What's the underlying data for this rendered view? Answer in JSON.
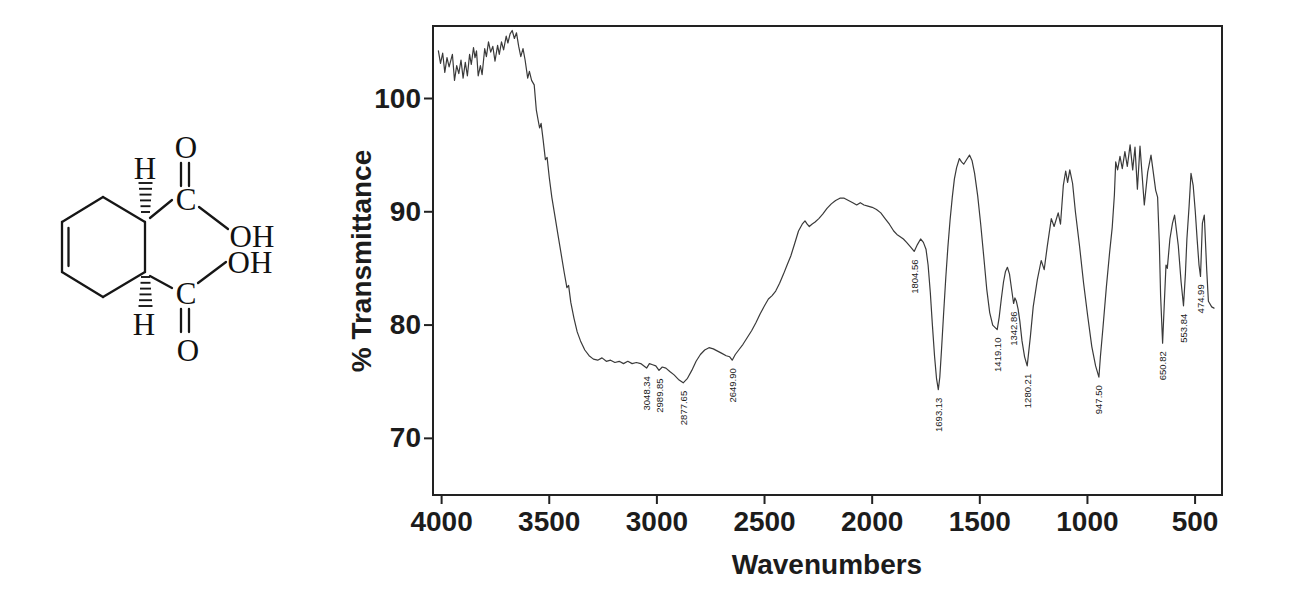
{
  "structure": {
    "compound": "cis-4-cyclohexene-1,2-dicarboxylic acid",
    "atoms": [
      {
        "id": "o-upper",
        "label": "O"
      },
      {
        "id": "c-upper",
        "label": "C"
      },
      {
        "id": "oh-upper",
        "label": "OH"
      },
      {
        "id": "oh-lower",
        "label": "OH"
      },
      {
        "id": "c-lower",
        "label": "C"
      },
      {
        "id": "o-lower",
        "label": "O"
      },
      {
        "id": "h-upper",
        "label": "H"
      },
      {
        "id": "h-lower",
        "label": "H"
      }
    ]
  },
  "chart_data": {
    "type": "line",
    "title": "",
    "xlabel": "Wavenumbers",
    "ylabel": "% Transmittance",
    "x_axis": {
      "min": 375,
      "max": 4040,
      "reversed": true,
      "ticks": [
        4000,
        3500,
        3000,
        2500,
        2000,
        1500,
        1000,
        500
      ]
    },
    "y_axis": {
      "min": 65,
      "max": 106.4,
      "ticks": [
        70,
        80,
        90,
        100
      ]
    },
    "grid": false,
    "legend": false,
    "peak_labels": [
      {
        "text": "3048.34",
        "wn": 3048.34,
        "t": 75.85
      },
      {
        "text": "2989.85",
        "wn": 2989.85,
        "t": 75.65
      },
      {
        "text": "2877.65",
        "wn": 2877.65,
        "t": 74.55
      },
      {
        "text": "2649.90",
        "wn": 2649.9,
        "t": 76.55
      },
      {
        "text": "1804.56",
        "wn": 1804.56,
        "t": 86.15
      },
      {
        "text": "1693.13",
        "wn": 1693.13,
        "t": 73.95
      },
      {
        "text": "1419.10",
        "wn": 1419.1,
        "t": 79.25
      },
      {
        "text": "1342.86",
        "wn": 1342.86,
        "t": 81.55
      },
      {
        "text": "1280.21",
        "wn": 1280.21,
        "t": 76.05
      },
      {
        "text": "947.50",
        "wn": 947.5,
        "t": 75.05
      },
      {
        "text": "650.82",
        "wn": 650.82,
        "t": 78.05
      },
      {
        "text": "553.84",
        "wn": 553.84,
        "t": 81.35
      },
      {
        "text": "474.99",
        "wn": 474.99,
        "t": 83.95
      }
    ],
    "series": [
      {
        "name": "% transmittance vs wavenumber",
        "points": [
          [
            4015,
            104.2
          ],
          [
            4005,
            103.1
          ],
          [
            3995,
            104.0
          ],
          [
            3985,
            102.3
          ],
          [
            3975,
            103.6
          ],
          [
            3965,
            102.8
          ],
          [
            3950,
            103.9
          ],
          [
            3940,
            101.6
          ],
          [
            3930,
            102.9
          ],
          [
            3920,
            102.2
          ],
          [
            3910,
            103.4
          ],
          [
            3900,
            101.8
          ],
          [
            3890,
            103.2
          ],
          [
            3880,
            102.0
          ],
          [
            3870,
            103.9
          ],
          [
            3862,
            103.0
          ],
          [
            3852,
            104.5
          ],
          [
            3845,
            103.6
          ],
          [
            3838,
            104.2
          ],
          [
            3830,
            102.0
          ],
          [
            3820,
            102.9
          ],
          [
            3812,
            102.1
          ],
          [
            3800,
            104.4
          ],
          [
            3792,
            103.7
          ],
          [
            3782,
            105.0
          ],
          [
            3772,
            104.1
          ],
          [
            3762,
            104.6
          ],
          [
            3752,
            103.3
          ],
          [
            3740,
            104.7
          ],
          [
            3732,
            103.9
          ],
          [
            3722,
            105.0
          ],
          [
            3712,
            104.3
          ],
          [
            3700,
            105.5
          ],
          [
            3692,
            104.9
          ],
          [
            3682,
            105.7
          ],
          [
            3672,
            106.0
          ],
          [
            3662,
            105.3
          ],
          [
            3652,
            105.8
          ],
          [
            3642,
            104.6
          ],
          [
            3632,
            103.7
          ],
          [
            3622,
            104.4
          ],
          [
            3612,
            103.4
          ],
          [
            3600,
            101.8
          ],
          [
            3592,
            102.4
          ],
          [
            3582,
            101.6
          ],
          [
            3570,
            101.2
          ],
          [
            3560,
            99.0
          ],
          [
            3552,
            98.1
          ],
          [
            3545,
            97.4
          ],
          [
            3538,
            97.8
          ],
          [
            3528,
            96.3
          ],
          [
            3518,
            94.6
          ],
          [
            3510,
            94.8
          ],
          [
            3500,
            93.0
          ],
          [
            3488,
            91.3
          ],
          [
            3475,
            89.8
          ],
          [
            3460,
            88.0
          ],
          [
            3445,
            86.3
          ],
          [
            3430,
            84.6
          ],
          [
            3418,
            83.3
          ],
          [
            3410,
            83.5
          ],
          [
            3400,
            82.0
          ],
          [
            3385,
            80.6
          ],
          [
            3370,
            79.4
          ],
          [
            3355,
            78.6
          ],
          [
            3335,
            77.8
          ],
          [
            3315,
            77.3
          ],
          [
            3295,
            77.0
          ],
          [
            3275,
            76.9
          ],
          [
            3255,
            77.1
          ],
          [
            3235,
            76.8
          ],
          [
            3215,
            76.9
          ],
          [
            3195,
            76.7
          ],
          [
            3175,
            76.8
          ],
          [
            3155,
            76.6
          ],
          [
            3135,
            76.8
          ],
          [
            3115,
            76.6
          ],
          [
            3095,
            76.7
          ],
          [
            3075,
            76.6
          ],
          [
            3048,
            76.2
          ],
          [
            3035,
            76.6
          ],
          [
            3020,
            76.5
          ],
          [
            3005,
            76.4
          ],
          [
            2990,
            76.0
          ],
          [
            2975,
            76.3
          ],
          [
            2958,
            76.2
          ],
          [
            2940,
            75.9
          ],
          [
            2920,
            75.6
          ],
          [
            2900,
            75.2
          ],
          [
            2878,
            74.9
          ],
          [
            2858,
            75.3
          ],
          [
            2838,
            76.0
          ],
          [
            2818,
            76.8
          ],
          [
            2798,
            77.4
          ],
          [
            2778,
            77.8
          ],
          [
            2758,
            78.0
          ],
          [
            2738,
            77.9
          ],
          [
            2718,
            77.7
          ],
          [
            2698,
            77.5
          ],
          [
            2678,
            77.3
          ],
          [
            2662,
            77.2
          ],
          [
            2650,
            76.9
          ],
          [
            2636,
            77.4
          ],
          [
            2620,
            77.8
          ],
          [
            2600,
            78.3
          ],
          [
            2580,
            78.9
          ],
          [
            2560,
            79.5
          ],
          [
            2540,
            80.2
          ],
          [
            2520,
            81.0
          ],
          [
            2500,
            81.7
          ],
          [
            2482,
            82.3
          ],
          [
            2465,
            82.6
          ],
          [
            2448,
            83.0
          ],
          [
            2430,
            83.7
          ],
          [
            2412,
            84.5
          ],
          [
            2395,
            85.3
          ],
          [
            2378,
            86.1
          ],
          [
            2360,
            87.2
          ],
          [
            2342,
            88.3
          ],
          [
            2325,
            88.9
          ],
          [
            2312,
            89.2
          ],
          [
            2302,
            88.9
          ],
          [
            2292,
            88.7
          ],
          [
            2280,
            88.9
          ],
          [
            2265,
            89.1
          ],
          [
            2248,
            89.4
          ],
          [
            2230,
            89.8
          ],
          [
            2210,
            90.3
          ],
          [
            2190,
            90.7
          ],
          [
            2170,
            91.0
          ],
          [
            2150,
            91.2
          ],
          [
            2130,
            91.2
          ],
          [
            2110,
            91.0
          ],
          [
            2090,
            90.8
          ],
          [
            2072,
            90.6
          ],
          [
            2055,
            90.8
          ],
          [
            2038,
            90.6
          ],
          [
            2020,
            90.5
          ],
          [
            2000,
            90.4
          ],
          [
            1980,
            90.2
          ],
          [
            1960,
            89.9
          ],
          [
            1940,
            89.4
          ],
          [
            1920,
            88.9
          ],
          [
            1900,
            88.3
          ],
          [
            1885,
            88.0
          ],
          [
            1870,
            87.8
          ],
          [
            1855,
            87.6
          ],
          [
            1840,
            87.3
          ],
          [
            1822,
            86.9
          ],
          [
            1805,
            86.5
          ],
          [
            1790,
            87.1
          ],
          [
            1775,
            87.6
          ],
          [
            1762,
            87.3
          ],
          [
            1750,
            86.7
          ],
          [
            1740,
            85.3
          ],
          [
            1730,
            82.9
          ],
          [
            1720,
            80.0
          ],
          [
            1710,
            77.2
          ],
          [
            1701,
            75.3
          ],
          [
            1693,
            74.3
          ],
          [
            1686,
            75.4
          ],
          [
            1678,
            77.8
          ],
          [
            1668,
            81.0
          ],
          [
            1658,
            84.2
          ],
          [
            1648,
            86.9
          ],
          [
            1638,
            89.3
          ],
          [
            1628,
            91.3
          ],
          [
            1618,
            92.9
          ],
          [
            1608,
            93.9
          ],
          [
            1595,
            94.7
          ],
          [
            1585,
            94.4
          ],
          [
            1575,
            94.2
          ],
          [
            1562,
            94.6
          ],
          [
            1548,
            95.0
          ],
          [
            1536,
            94.5
          ],
          [
            1524,
            93.4
          ],
          [
            1510,
            91.4
          ],
          [
            1496,
            88.9
          ],
          [
            1482,
            86.1
          ],
          [
            1468,
            83.2
          ],
          [
            1454,
            81.1
          ],
          [
            1440,
            80.0
          ],
          [
            1419,
            79.6
          ],
          [
            1410,
            80.7
          ],
          [
            1400,
            82.3
          ],
          [
            1390,
            83.8
          ],
          [
            1381,
            84.7
          ],
          [
            1372,
            85.1
          ],
          [
            1362,
            84.5
          ],
          [
            1352,
            83.1
          ],
          [
            1343,
            81.9
          ],
          [
            1337,
            82.4
          ],
          [
            1330,
            82.1
          ],
          [
            1322,
            81.4
          ],
          [
            1314,
            80.3
          ],
          [
            1304,
            78.6
          ],
          [
            1292,
            77.2
          ],
          [
            1280,
            76.4
          ],
          [
            1265,
            79.0
          ],
          [
            1252,
            81.6
          ],
          [
            1233,
            84.0
          ],
          [
            1215,
            85.7
          ],
          [
            1201,
            84.9
          ],
          [
            1187,
            86.9
          ],
          [
            1168,
            89.4
          ],
          [
            1155,
            88.7
          ],
          [
            1136,
            89.9
          ],
          [
            1125,
            88.9
          ],
          [
            1112,
            92.3
          ],
          [
            1101,
            93.6
          ],
          [
            1092,
            92.6
          ],
          [
            1082,
            93.7
          ],
          [
            1069,
            92.5
          ],
          [
            1056,
            90.0
          ],
          [
            1037,
            87.0
          ],
          [
            1018,
            83.7
          ],
          [
            999,
            80.8
          ],
          [
            980,
            78.1
          ],
          [
            962,
            76.4
          ],
          [
            947,
            75.4
          ],
          [
            940,
            77.2
          ],
          [
            928,
            79.8
          ],
          [
            912,
            83.4
          ],
          [
            897,
            86.4
          ],
          [
            885,
            88.6
          ],
          [
            875,
            91.5
          ],
          [
            869,
            94.4
          ],
          [
            860,
            93.7
          ],
          [
            849,
            94.9
          ],
          [
            838,
            93.8
          ],
          [
            826,
            95.3
          ],
          [
            815,
            94.0
          ],
          [
            802,
            95.9
          ],
          [
            790,
            93.7
          ],
          [
            779,
            95.7
          ],
          [
            768,
            92.0
          ],
          [
            756,
            95.8
          ],
          [
            736,
            90.6
          ],
          [
            720,
            93.5
          ],
          [
            705,
            95.0
          ],
          [
            683,
            91.9
          ],
          [
            674,
            91.3
          ],
          [
            666,
            87.0
          ],
          [
            660,
            82.6
          ],
          [
            651,
            78.4
          ],
          [
            643,
            81.9
          ],
          [
            635,
            85.3
          ],
          [
            629,
            85.0
          ],
          [
            617,
            87.6
          ],
          [
            605,
            89.0
          ],
          [
            595,
            89.7
          ],
          [
            578,
            87.0
          ],
          [
            565,
            83.8
          ],
          [
            554,
            81.7
          ],
          [
            545,
            84.5
          ],
          [
            538,
            87.6
          ],
          [
            528,
            90.5
          ],
          [
            519,
            93.4
          ],
          [
            509,
            92.3
          ],
          [
            499,
            90.0
          ],
          [
            490,
            87.5
          ],
          [
            482,
            85.3
          ],
          [
            475,
            84.3
          ],
          [
            466,
            89.0
          ],
          [
            457,
            89.7
          ],
          [
            446,
            84.9
          ],
          [
            438,
            82.1
          ],
          [
            423,
            81.6
          ],
          [
            412,
            81.5
          ]
        ]
      }
    ]
  }
}
